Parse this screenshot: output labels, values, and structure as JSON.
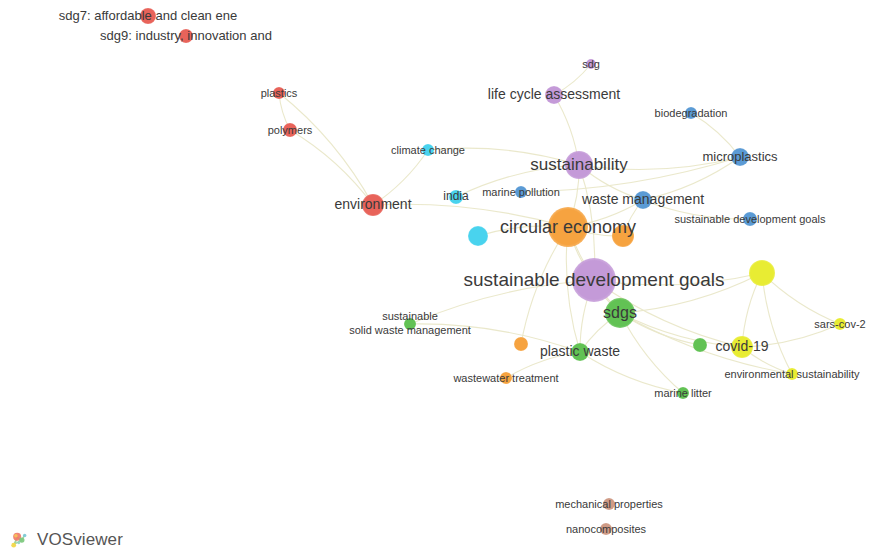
{
  "app": {
    "name": "VOSviewer",
    "brand_label": "VOSviewer",
    "logo_icon": "vosviewer-network-logo-icon",
    "canvas_width": 878,
    "canvas_height": 557,
    "background_color": "#ffffff",
    "label_color": "#3a3a3a"
  },
  "cluster_colors": {
    "red": "#e8635a",
    "orange": "#f6a340",
    "purple": "#c49ad8",
    "blue": "#5b9bd5",
    "cyan": "#49d3ee",
    "green": "#62c254",
    "yellow": "#e8ec33",
    "brown": "#cf9b86"
  },
  "chart_data": {
    "type": "scatter",
    "title": "",
    "xlabel": "",
    "ylabel": "",
    "nodes": [
      {
        "id": "sdg7",
        "label": "sdg7: affordable and clean ene",
        "x": 148,
        "y": 16,
        "r": 8,
        "color": "#e8635a",
        "font_size": 13,
        "label_dx": 0,
        "label_dy": 0
      },
      {
        "id": "sdg9",
        "label": "sdg9: industry, innovation and",
        "x": 186,
        "y": 36,
        "r": 7,
        "color": "#e8635a",
        "font_size": 13,
        "label_dx": 0,
        "label_dy": 0
      },
      {
        "id": "plastics",
        "label": "plastics",
        "x": 279,
        "y": 93,
        "r": 6,
        "color": "#e8635a",
        "font_size": 11,
        "label_dx": 0,
        "label_dy": 0
      },
      {
        "id": "polymers",
        "label": "polymers",
        "x": 290,
        "y": 130,
        "r": 7,
        "color": "#e8635a",
        "font_size": 11,
        "label_dx": 0,
        "label_dy": 0
      },
      {
        "id": "climate",
        "label": "climate change",
        "x": 428,
        "y": 150,
        "r": 6,
        "color": "#49d3ee",
        "font_size": 11,
        "label_dx": 0,
        "label_dy": 0
      },
      {
        "id": "sdg",
        "label": "sdg",
        "x": 591,
        "y": 64,
        "r": 5,
        "color": "#c49ad8",
        "font_size": 11,
        "label_dx": 0,
        "label_dy": 0
      },
      {
        "id": "lca",
        "label": "life cycle assessment",
        "x": 554,
        "y": 95,
        "r": 9,
        "color": "#c49ad8",
        "font_size": 14,
        "label_dx": 0,
        "label_dy": 0
      },
      {
        "id": "biodeg",
        "label": "biodegradation",
        "x": 691,
        "y": 113,
        "r": 6,
        "color": "#5b9bd5",
        "font_size": 11,
        "label_dx": 0,
        "label_dy": 0
      },
      {
        "id": "microplast",
        "label": "microplastics",
        "x": 740,
        "y": 157,
        "r": 9,
        "color": "#5b9bd5",
        "font_size": 13,
        "label_dx": 0,
        "label_dy": 0
      },
      {
        "id": "sustain",
        "label": "sustainability",
        "x": 579,
        "y": 165,
        "r": 14,
        "color": "#c49ad8",
        "font_size": 17,
        "label_dx": 0,
        "label_dy": 0
      },
      {
        "id": "environment",
        "label": "environment",
        "x": 373,
        "y": 205,
        "r": 11,
        "color": "#e8635a",
        "font_size": 14,
        "label_dx": 0,
        "label_dy": 0
      },
      {
        "id": "india",
        "label": "india",
        "x": 456,
        "y": 197,
        "r": 7,
        "color": "#49d3ee",
        "font_size": 12,
        "label_dx": 0,
        "label_dy": 0
      },
      {
        "id": "marinepoll",
        "label": "marine pollution",
        "x": 521,
        "y": 192,
        "r": 6,
        "color": "#5b9bd5",
        "font_size": 11,
        "label_dx": 0,
        "label_dy": 0
      },
      {
        "id": "wastemgmt",
        "label": "waste management",
        "x": 643,
        "y": 200,
        "r": 9,
        "color": "#5b9bd5",
        "font_size": 14,
        "label_dx": 0,
        "label_dy": 0
      },
      {
        "id": "sdgoals_b",
        "label": "sustainable development goals",
        "x": 750,
        "y": 219,
        "r": 7,
        "color": "#5b9bd5",
        "font_size": 11,
        "label_dx": 0,
        "label_dy": 0
      },
      {
        "id": "circecon",
        "label": "circular economy",
        "x": 568,
        "y": 227,
        "r": 20,
        "color": "#f6a340",
        "font_size": 18,
        "label_dx": 0,
        "label_dy": 0
      },
      {
        "id": "cyan_small",
        "label": "",
        "x": 478,
        "y": 236,
        "r": 10,
        "color": "#49d3ee",
        "font_size": 11,
        "label_dx": 0,
        "label_dy": 0
      },
      {
        "id": "orange_sm1",
        "label": "",
        "x": 623,
        "y": 236,
        "r": 11,
        "color": "#f6a340",
        "font_size": 11,
        "label_dx": 0,
        "label_dy": 0
      },
      {
        "id": "sdgoals_p",
        "label": "sustainable development goals",
        "x": 594,
        "y": 280,
        "r": 22,
        "color": "#c49ad8",
        "font_size": 19,
        "label_dx": 0,
        "label_dy": 0
      },
      {
        "id": "yellow_big",
        "label": "",
        "x": 762,
        "y": 273,
        "r": 13,
        "color": "#e8ec33",
        "font_size": 11,
        "label_dx": 0,
        "label_dy": 0
      },
      {
        "id": "susolid",
        "label": "sustainable\nsolid waste management",
        "x": 410,
        "y": 324,
        "r": 6,
        "color": "#62c254",
        "font_size": 11,
        "label_dx": 0,
        "label_dy": 0
      },
      {
        "id": "sdgs",
        "label": "sdgs",
        "x": 620,
        "y": 313,
        "r": 15,
        "color": "#62c254",
        "font_size": 16,
        "label_dx": 0,
        "label_dy": 0
      },
      {
        "id": "sarscov2",
        "label": "sars-cov-2",
        "x": 840,
        "y": 324,
        "r": 6,
        "color": "#e8ec33",
        "font_size": 11,
        "label_dx": 0,
        "label_dy": 0
      },
      {
        "id": "orange_sm2",
        "label": "",
        "x": 521,
        "y": 344,
        "r": 7,
        "color": "#f6a340",
        "font_size": 11,
        "label_dx": 0,
        "label_dy": 0
      },
      {
        "id": "plasticwaste",
        "label": "plastic waste",
        "x": 580,
        "y": 352,
        "r": 9,
        "color": "#62c254",
        "font_size": 14,
        "label_dx": 0,
        "label_dy": 0
      },
      {
        "id": "green_sm",
        "label": "",
        "x": 700,
        "y": 345,
        "r": 7,
        "color": "#62c254",
        "font_size": 11,
        "label_dx": 0,
        "label_dy": 0
      },
      {
        "id": "covid19",
        "label": "covid-19",
        "x": 742,
        "y": 347,
        "r": 11,
        "color": "#e8ec33",
        "font_size": 14,
        "label_dx": 0,
        "label_dy": 0
      },
      {
        "id": "wastewater",
        "label": "wastewater treatment",
        "x": 506,
        "y": 378,
        "r": 6,
        "color": "#f6a340",
        "font_size": 11,
        "label_dx": 0,
        "label_dy": 0
      },
      {
        "id": "envsustain",
        "label": "environmental sustainability",
        "x": 792,
        "y": 374,
        "r": 6,
        "color": "#e8ec33",
        "font_size": 11,
        "label_dx": 0,
        "label_dy": 0
      },
      {
        "id": "marinelitter",
        "label": "marine litter",
        "x": 683,
        "y": 393,
        "r": 6,
        "color": "#62c254",
        "font_size": 11,
        "label_dx": 0,
        "label_dy": 0
      },
      {
        "id": "mechprops",
        "label": "mechanical properties",
        "x": 609,
        "y": 504,
        "r": 6,
        "color": "#cf9b86",
        "font_size": 11,
        "label_dx": 0,
        "label_dy": 0
      },
      {
        "id": "nanocomp",
        "label": "nanocomposites",
        "x": 606,
        "y": 529,
        "r": 6,
        "color": "#cf9b86",
        "font_size": 11,
        "label_dx": 0,
        "label_dy": 0
      }
    ],
    "edges": [
      {
        "from": "circecon",
        "to": "sdgoals_p"
      },
      {
        "from": "circecon",
        "to": "sustain"
      },
      {
        "from": "circecon",
        "to": "cyan_small"
      },
      {
        "from": "circecon",
        "to": "orange_sm1"
      },
      {
        "from": "circecon",
        "to": "sdgs"
      },
      {
        "from": "circecon",
        "to": "wastemgmt"
      },
      {
        "from": "circecon",
        "to": "plasticwaste"
      },
      {
        "from": "circecon",
        "to": "orange_sm2"
      },
      {
        "from": "circecon",
        "to": "environment"
      },
      {
        "from": "sdgoals_p",
        "to": "sdgs"
      },
      {
        "from": "sdgoals_p",
        "to": "yellow_big"
      },
      {
        "from": "sdgoals_p",
        "to": "sustain"
      },
      {
        "from": "sdgoals_p",
        "to": "plasticwaste"
      },
      {
        "from": "sdgoals_p",
        "to": "covid19"
      },
      {
        "from": "sdgoals_p",
        "to": "susolid"
      },
      {
        "from": "sdgs",
        "to": "plasticwaste"
      },
      {
        "from": "sdgs",
        "to": "covid19"
      },
      {
        "from": "sdgs",
        "to": "yellow_big"
      },
      {
        "from": "sdgs",
        "to": "marinelitter"
      },
      {
        "from": "sdgs",
        "to": "green_sm"
      },
      {
        "from": "sdgs",
        "to": "envsustain"
      },
      {
        "from": "yellow_big",
        "to": "covid19"
      },
      {
        "from": "yellow_big",
        "to": "sarscov2"
      },
      {
        "from": "yellow_big",
        "to": "envsustain"
      },
      {
        "from": "covid19",
        "to": "envsustain"
      },
      {
        "from": "covid19",
        "to": "sarscov2"
      },
      {
        "from": "sustain",
        "to": "lca"
      },
      {
        "from": "sustain",
        "to": "wastemgmt"
      },
      {
        "from": "sustain",
        "to": "microplast"
      },
      {
        "from": "sustain",
        "to": "climate"
      },
      {
        "from": "sustain",
        "to": "india"
      },
      {
        "from": "wastemgmt",
        "to": "sdgoals_b"
      },
      {
        "from": "wastemgmt",
        "to": "microplast"
      },
      {
        "from": "wastemgmt",
        "to": "orange_sm1"
      },
      {
        "from": "environment",
        "to": "polymers"
      },
      {
        "from": "environment",
        "to": "plastics"
      },
      {
        "from": "environment",
        "to": "climate"
      },
      {
        "from": "plastics",
        "to": "polymers"
      },
      {
        "from": "plasticwaste",
        "to": "marinelitter"
      },
      {
        "from": "plasticwaste",
        "to": "wastewater"
      },
      {
        "from": "plasticwaste",
        "to": "susolid"
      },
      {
        "from": "lca",
        "to": "sdg"
      },
      {
        "from": "microplast",
        "to": "biodeg"
      },
      {
        "from": "marinepoll",
        "to": "microplast"
      }
    ],
    "edge_color": "#e9e7c8",
    "legend": null,
    "grid": false
  }
}
